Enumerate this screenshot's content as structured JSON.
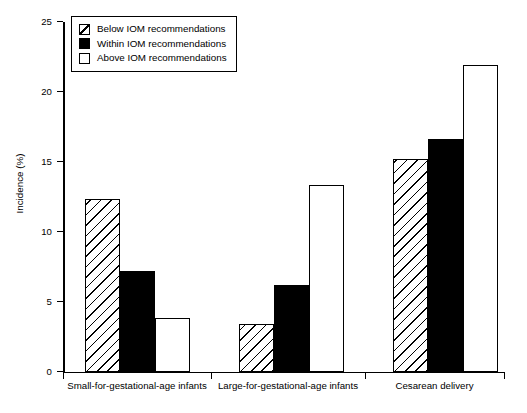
{
  "chart_data": {
    "type": "bar",
    "title": "",
    "xlabel": "",
    "ylabel": "Incidence (%)",
    "ylim": [
      0,
      25
    ],
    "yticks": [
      0,
      5,
      10,
      15,
      20,
      25
    ],
    "ytick_labels": [
      "0",
      "5",
      "10",
      "15",
      "20",
      "25"
    ],
    "grid": false,
    "legend_position": "upper-left",
    "categories": [
      "Small-for-gestational-age infants",
      "Large-for-gestational-age infants",
      "Cesarean delivery"
    ],
    "series": [
      {
        "name": "Below IOM recommendations",
        "swatch": "hatched",
        "values": [
          12.35,
          3.4,
          15.15
        ]
      },
      {
        "name": "Within IOM recommendations",
        "swatch": "solid-black",
        "values": [
          7.15,
          6.2,
          16.6
        ]
      },
      {
        "name": "Above IOM recommendations",
        "swatch": "white",
        "values": [
          3.8,
          13.35,
          21.9
        ]
      }
    ]
  },
  "legend": {
    "items": [
      {
        "label": "Below IOM recommendations"
      },
      {
        "label": "Within IOM recommendations"
      },
      {
        "label": "Above IOM recommendations"
      }
    ]
  },
  "colors": {
    "axis": "#000000",
    "bar_outline": "#000000",
    "within_fill": "#000000",
    "above_fill": "#ffffff",
    "background": "#ffffff"
  }
}
